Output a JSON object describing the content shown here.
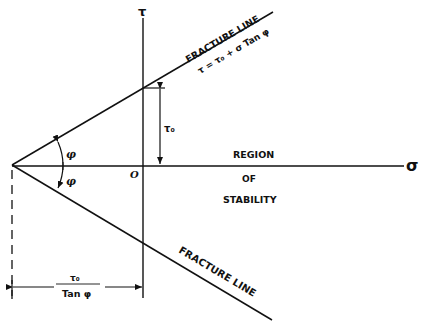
{
  "diagram": {
    "type": "mohr-coulomb-failure-envelope",
    "axes": {
      "vertical_label": "τ",
      "horizontal_label": "σ",
      "origin_label": "O"
    },
    "upper_line": {
      "label": "FRACTURE LINE",
      "equation": "τ = τ₀ + σ Tan φ"
    },
    "lower_line": {
      "label": "FRACTURE LINE"
    },
    "angle_label_upper": "φ",
    "angle_label_lower": "φ",
    "intercept_label": "τ₀",
    "horizontal_dimension": {
      "numerator": "τ₀",
      "denominator": "Tan φ"
    },
    "region_label": {
      "line1": "REGION",
      "line2": "OF",
      "line3": "STABILITY"
    },
    "colors": {
      "line": "#111111",
      "background": "#ffffff"
    }
  }
}
